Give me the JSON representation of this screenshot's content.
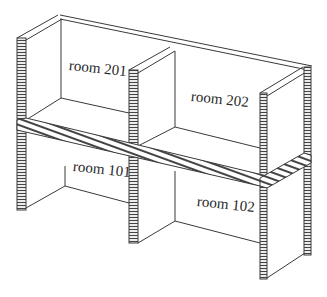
{
  "diagram": {
    "type": "isometric building section",
    "rooms": [
      {
        "id": "r201",
        "label": "room 201",
        "floor": 2,
        "position": "left"
      },
      {
        "id": "r202",
        "label": "room 202",
        "floor": 2,
        "position": "right"
      },
      {
        "id": "r101",
        "label": "room 101",
        "floor": 1,
        "position": "left"
      },
      {
        "id": "r102",
        "label": "room 102",
        "floor": 1,
        "position": "right"
      }
    ],
    "colors": {
      "line": "#3a3a3a",
      "hatch": "#4a4a4a",
      "background": "#ffffff"
    }
  }
}
